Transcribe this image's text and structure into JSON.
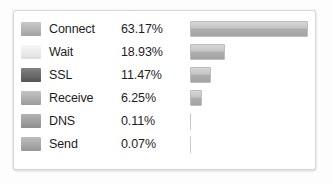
{
  "panel": {
    "name": "network-timing-breakdown-panel",
    "background": "#ffffff",
    "border_color": "#d8d8d8"
  },
  "chart_data": {
    "type": "bar",
    "title": "",
    "xlabel": "",
    "ylabel": "",
    "orientation": "horizontal",
    "grid": false,
    "legend": "inline-swatch",
    "xlim": [
      0,
      65
    ],
    "categories": [
      "Connect",
      "Wait",
      "SSL",
      "Receive",
      "DNS",
      "Send"
    ],
    "values": [
      63.17,
      18.93,
      11.47,
      6.25,
      0.11,
      0.07
    ],
    "value_labels": [
      "63.17%",
      "18.93%",
      "11.47%",
      "6.25%",
      "0.11%",
      "0.07%"
    ],
    "swatch_colors": [
      "#b4b4b4",
      "#eaeaea",
      "#6a6a6a",
      "#aeaeae",
      "#9f9f9f",
      "#a8a8a8"
    ],
    "bar_color": "#b6b6b6",
    "max_value": 63.17
  },
  "rows": [
    {
      "label": "Connect",
      "percent": "63.17%",
      "value": 63.17,
      "swatch": "#b4b4b4",
      "swatch_top": "#c9c9c9",
      "swatch_bottom": "#a2a2a2"
    },
    {
      "label": "Wait",
      "percent": "18.93%",
      "value": 18.93,
      "swatch": "#eaeaea",
      "swatch_top": "#f6f6f6",
      "swatch_bottom": "#dedede"
    },
    {
      "label": "SSL",
      "percent": "11.47%",
      "value": 11.47,
      "swatch": "#6a6a6a",
      "swatch_top": "#818181",
      "swatch_bottom": "#555555"
    },
    {
      "label": "Receive",
      "percent": "6.25%",
      "value": 6.25,
      "swatch": "#aeaeae",
      "swatch_top": "#c4c4c4",
      "swatch_bottom": "#9a9a9a"
    },
    {
      "label": "DNS",
      "percent": "0.11%",
      "value": 0.11,
      "swatch": "#9f9f9f",
      "swatch_top": "#b3b3b3",
      "swatch_bottom": "#8d8d8d"
    },
    {
      "label": "Send",
      "percent": "0.07%",
      "value": 0.07,
      "swatch": "#a8a8a8",
      "swatch_top": "#bcbcbc",
      "swatch_bottom": "#969696"
    }
  ]
}
